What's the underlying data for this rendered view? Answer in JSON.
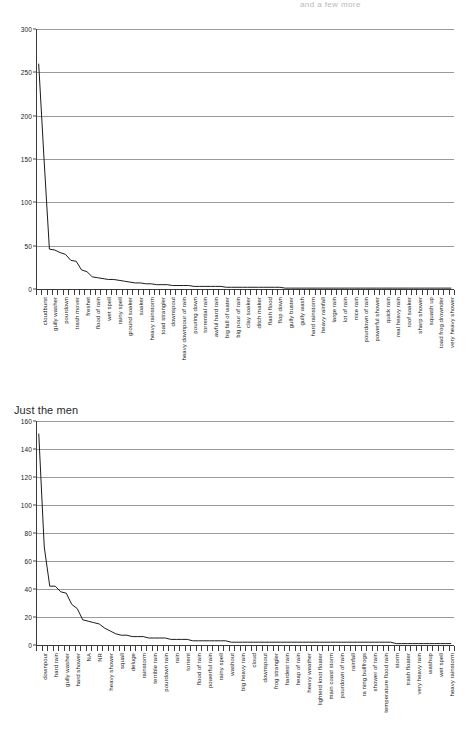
{
  "page": {
    "cutoff_text": "and a few more"
  },
  "charts": [
    {
      "id": "chart-top",
      "title": "",
      "has_title": false
    },
    {
      "id": "chart-bottom",
      "title": "Just the men",
      "has_title": true
    }
  ],
  "chart_data": [
    {
      "type": "line",
      "title": "",
      "subtitle": "",
      "xlabel": "",
      "ylabel": "",
      "ylim": [
        0,
        300
      ],
      "yticks": [
        0,
        50,
        100,
        150,
        200,
        250,
        300
      ],
      "grid": true,
      "legend": "none",
      "categories": [
        "cloudburst",
        "downpour",
        "gully washer",
        "hard rain",
        "pourdown",
        "heavy shower",
        "trash mover",
        "hard shower",
        "freshet",
        "rainstorm",
        "flood of rain",
        "deluge",
        "wet spell",
        "squall",
        "rainy spell",
        "terrible rain",
        "ground soaker",
        "torrent",
        "soaker",
        "washout",
        "heavy rainstorm",
        "rain",
        "toad strangler",
        "frog strangler",
        "downspout",
        "cloud",
        "heavy downpour of rain",
        "heap of rain",
        "pouring down",
        "heavy rain",
        "torrential rain",
        "gusher",
        "awful hard rain",
        "big rain",
        "big fall of water",
        "blowing rain",
        "big pour of rain",
        "chunk floater",
        "clay soaker",
        "dam buster",
        "ditch maker",
        "drencher",
        "flash flood",
        "flood",
        "flop down",
        "goose drownder",
        "gully buster",
        "gully flusher",
        "gully wash",
        "hard downpour",
        "hard rainstorm",
        "heavy fall of rain",
        "heavy rainfall",
        "heavy storm",
        "large rain",
        "light rain",
        "lot of rain",
        "much rain",
        "nice rain",
        "pouring rain",
        "pourdown of rain",
        "powerful rain",
        "powerful shower",
        "pouring storm",
        "quick rain",
        "real good rain",
        "real heavy rain",
        "regular downpour",
        "roof soaker",
        "severe storm",
        "sharp shower",
        "soaking rain",
        "squash up",
        "strong rain",
        "toad frog drownder",
        "turd floater",
        "very heavy shower",
        "violent rain"
      ],
      "values": [
        260,
        150,
        46,
        45,
        42,
        40,
        33,
        32,
        22,
        20,
        14,
        13,
        12,
        11,
        11,
        10,
        9,
        8,
        7,
        7,
        6,
        6,
        5,
        5,
        5,
        4,
        4,
        4,
        4,
        3,
        3,
        3,
        3,
        3,
        3,
        2,
        2,
        2,
        2,
        2,
        2,
        2,
        2,
        2,
        2,
        2,
        1,
        1,
        1,
        1,
        1,
        1,
        1,
        1,
        1,
        1,
        1,
        1,
        1,
        1,
        1,
        1,
        1,
        1,
        1,
        1,
        1,
        1,
        1,
        1,
        1,
        1,
        1,
        1,
        1,
        1,
        1,
        1
      ],
      "visible_tick_labels": [
        {
          "index": 0,
          "label": "cloudburst"
        },
        {
          "index": 2,
          "label": "gully washer"
        },
        {
          "index": 4,
          "label": "pourdown"
        },
        {
          "index": 6,
          "label": "trash mover"
        },
        {
          "index": 8,
          "label": "freshet"
        },
        {
          "index": 10,
          "label": "flood of rain"
        },
        {
          "index": 12,
          "label": "wet spell"
        },
        {
          "index": 14,
          "label": "rainy spell"
        },
        {
          "index": 16,
          "label": "ground soaker"
        },
        {
          "index": 18,
          "label": "soaker"
        },
        {
          "index": 20,
          "label": "heavy rainstorm"
        },
        {
          "index": 22,
          "label": "toad strangler"
        },
        {
          "index": 24,
          "label": "downspout"
        },
        {
          "index": 26,
          "label": "heavy downpour of rain"
        },
        {
          "index": 28,
          "label": "pouring down"
        },
        {
          "index": 30,
          "label": "torrential rain"
        },
        {
          "index": 32,
          "label": "awful hard rain"
        },
        {
          "index": 34,
          "label": "big fall of water"
        },
        {
          "index": 36,
          "label": "big pour of rain"
        },
        {
          "index": 38,
          "label": "clay soaker"
        },
        {
          "index": 40,
          "label": "ditch maker"
        },
        {
          "index": 42,
          "label": "flash flood"
        },
        {
          "index": 44,
          "label": "flop down"
        },
        {
          "index": 46,
          "label": "gully buster"
        },
        {
          "index": 48,
          "label": "gully wash"
        },
        {
          "index": 50,
          "label": "hard rainstorm"
        },
        {
          "index": 52,
          "label": "heavy rainfall"
        },
        {
          "index": 54,
          "label": "large rain"
        },
        {
          "index": 56,
          "label": "lot of rain"
        },
        {
          "index": 58,
          "label": "nice rain"
        },
        {
          "index": 60,
          "label": "pourdown of rain"
        },
        {
          "index": 62,
          "label": "powerful shower"
        },
        {
          "index": 64,
          "label": "quick rain"
        },
        {
          "index": 66,
          "label": "real heavy rain"
        },
        {
          "index": 68,
          "label": "roof soaker"
        },
        {
          "index": 70,
          "label": "sharp shower"
        },
        {
          "index": 72,
          "label": "squash up"
        },
        {
          "index": 74,
          "label": "toad frog drownder"
        },
        {
          "index": 76,
          "label": "very heavy shower"
        }
      ]
    },
    {
      "type": "line",
      "title": "Just the men",
      "subtitle": "",
      "xlabel": "",
      "ylabel": "",
      "ylim": [
        0,
        160
      ],
      "yticks": [
        0,
        20,
        40,
        60,
        80,
        100,
        120,
        140,
        160
      ],
      "grid": true,
      "legend": "none",
      "categories": [
        "downpour",
        "cloudburst",
        "hard rain",
        "thunderstorm",
        "gully washer",
        "shower",
        "hard shower",
        "soaker",
        "NA",
        "drencher",
        "NR",
        "gusher",
        "heavy shower",
        "toad strangler",
        "squall",
        "trash mover",
        "deluge",
        "freshet",
        "rainstorm",
        "gully washer rain",
        "terrible rain",
        "soaking rain",
        "pourdown rain",
        "turd floater",
        "rain",
        "heavy rain",
        "torrent",
        "hard downpour",
        "flood of rain",
        "goose drownder",
        "powerful rain",
        "pouring rain",
        "rainy spell",
        "real good rain",
        "washout",
        "frog drownder",
        "big heavy rain",
        "chunk floater",
        "cloud",
        "dam buster",
        "downspout",
        "ditch mover",
        "frog strangler",
        "gully buster",
        "hardest rain",
        "heavy fall",
        "heap of rain",
        "heavy downpour",
        "heavy weather",
        "light rain",
        "lighterd knot floater",
        "lot of rain",
        "main coast storm",
        "mist",
        "pourdown of rain",
        "quick shower",
        "rainfall",
        "raining cats and dogs",
        "ra ning bullfrogs",
        "severe storm",
        "shower of rain",
        "sprinkle",
        "temperature flood rain",
        "stormy rain",
        "storm",
        "thunder shower",
        "trash floater",
        "turtle floater",
        "very heavy rain",
        "violent rain",
        "washup",
        "waterspout",
        "wet spell",
        "wet weather",
        "heavy rainstorm",
        "hurricane"
      ],
      "values": [
        151,
        70,
        42,
        42,
        38,
        37,
        29,
        26,
        18,
        17,
        16,
        15,
        12,
        10,
        8,
        7,
        7,
        6,
        6,
        6,
        5,
        5,
        5,
        5,
        4,
        4,
        4,
        4,
        3,
        3,
        3,
        3,
        3,
        3,
        3,
        2,
        2,
        2,
        2,
        2,
        2,
        2,
        2,
        2,
        2,
        2,
        2,
        2,
        2,
        2,
        2,
        2,
        2,
        2,
        2,
        2,
        2,
        2,
        2,
        2,
        2,
        2,
        2,
        2,
        2,
        1,
        1,
        1,
        1,
        1,
        1,
        1,
        1,
        1,
        1,
        1
      ],
      "visible_tick_labels": [
        {
          "index": 0,
          "label": "downpour"
        },
        {
          "index": 2,
          "label": "hard rain"
        },
        {
          "index": 4,
          "label": "gully washer"
        },
        {
          "index": 6,
          "label": "hard shower"
        },
        {
          "index": 8,
          "label": "NA"
        },
        {
          "index": 10,
          "label": "NR"
        },
        {
          "index": 12,
          "label": "heavy shower"
        },
        {
          "index": 14,
          "label": "squall"
        },
        {
          "index": 16,
          "label": "deluge"
        },
        {
          "index": 18,
          "label": "rainstorm"
        },
        {
          "index": 20,
          "label": "terrible rain"
        },
        {
          "index": 22,
          "label": "pourdown rain"
        },
        {
          "index": 24,
          "label": "rain"
        },
        {
          "index": 26,
          "label": "torrent"
        },
        {
          "index": 28,
          "label": "flood of rain"
        },
        {
          "index": 30,
          "label": "powerful rain"
        },
        {
          "index": 32,
          "label": "rainy spell"
        },
        {
          "index": 34,
          "label": "washout"
        },
        {
          "index": 36,
          "label": "big heavy rain"
        },
        {
          "index": 38,
          "label": "cloud"
        },
        {
          "index": 40,
          "label": "downspout"
        },
        {
          "index": 42,
          "label": "frog strangler"
        },
        {
          "index": 44,
          "label": "hardest rain"
        },
        {
          "index": 46,
          "label": "heap of rain"
        },
        {
          "index": 48,
          "label": "heavy weather"
        },
        {
          "index": 50,
          "label": "lighterd knot floater"
        },
        {
          "index": 52,
          "label": "main coast storm"
        },
        {
          "index": 54,
          "label": "pourdown of rain"
        },
        {
          "index": 56,
          "label": "rainfall"
        },
        {
          "index": 58,
          "label": "ra ning bullfrogs"
        },
        {
          "index": 60,
          "label": "shower of rain"
        },
        {
          "index": 62,
          "label": "temperature flood rain"
        },
        {
          "index": 64,
          "label": "storm"
        },
        {
          "index": 66,
          "label": "trash floater"
        },
        {
          "index": 68,
          "label": "very heavy rain"
        },
        {
          "index": 70,
          "label": "washup"
        },
        {
          "index": 72,
          "label": "wet spell"
        },
        {
          "index": 74,
          "label": "heavy rainstorm"
        }
      ]
    }
  ]
}
